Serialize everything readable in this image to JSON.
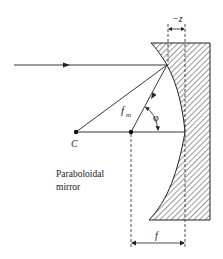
{
  "diagram": {
    "type": "optics-ray-diagram",
    "labels": {
      "minus_z": "−z",
      "f_m": "f",
      "f_m_sub": "m",
      "phi": "φ",
      "center": "C",
      "mirror_line1": "Paraboloidal",
      "mirror_line2": "mirror",
      "focal_length": "f"
    },
    "elements": [
      {
        "id": "incident-ray",
        "kind": "arrow",
        "desc": "horizontal ray traveling right toward mirror"
      },
      {
        "id": "reflected-ray",
        "kind": "arrow",
        "desc": "ray from mirror to focal point, length f_m"
      },
      {
        "id": "radius-line",
        "kind": "line",
        "desc": "line from C to reflection point"
      },
      {
        "id": "optical-axis",
        "kind": "line",
        "desc": "horizontal axis from C to mirror vertex"
      },
      {
        "id": "mirror",
        "kind": "hatched-solid",
        "desc": "paraboloidal mirror cross-section"
      },
      {
        "id": "dim-minus-z",
        "kind": "dimension",
        "desc": "sag -z between reflection point and vertex"
      },
      {
        "id": "dim-f",
        "kind": "dimension",
        "desc": "focal length f from focus to vertex"
      },
      {
        "id": "angle-phi",
        "kind": "angle-arc",
        "desc": "angle between reflected ray and axis"
      }
    ],
    "colors": {
      "stroke": "#222222",
      "hatch": "#333333",
      "background": "#ffffff"
    }
  }
}
